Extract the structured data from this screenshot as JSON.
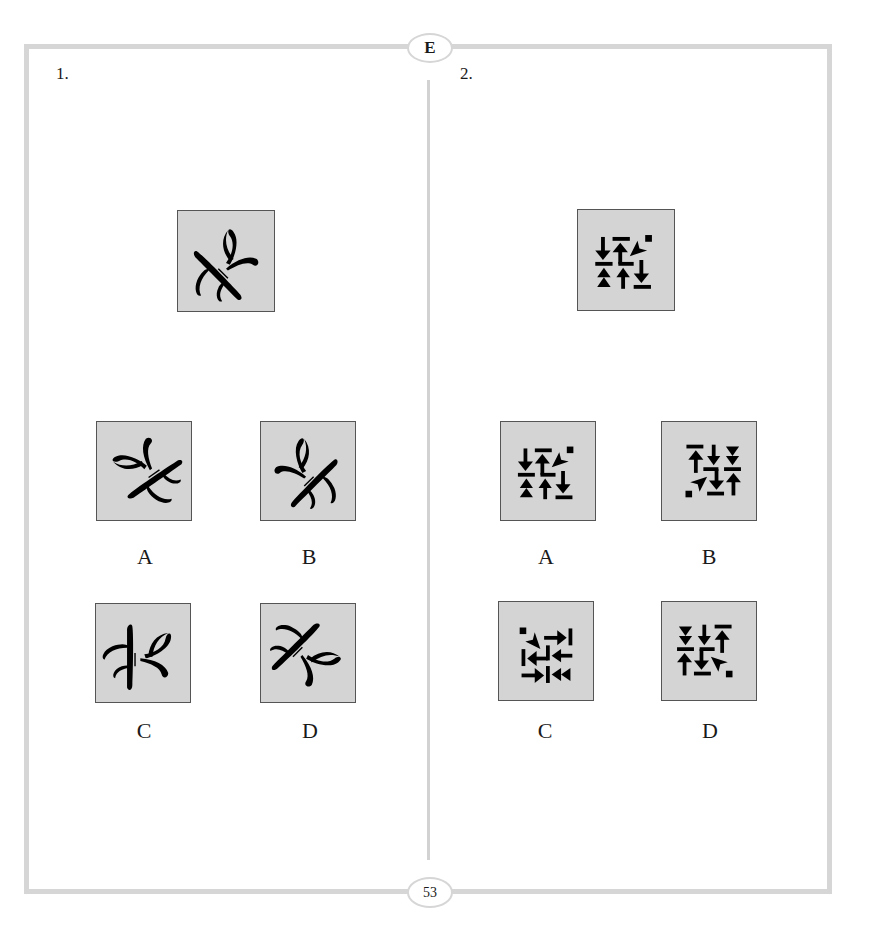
{
  "page": {
    "section_letter": "E",
    "page_number": "53",
    "colors": {
      "border": "#d6d6d6",
      "figure_bg": "#d4d4d4",
      "figure_ink": "#000000"
    }
  },
  "questions": [
    {
      "number": "1.",
      "stimulus_icon": "calligraphic-aleph-glyph",
      "options": [
        {
          "label": "A",
          "icon": "calligraphic-aleph-glyph-rotated"
        },
        {
          "label": "B",
          "icon": "calligraphic-aleph-glyph-mirrored"
        },
        {
          "label": "C",
          "icon": "calligraphic-aleph-glyph-upright"
        },
        {
          "label": "D",
          "icon": "calligraphic-aleph-glyph-rotated-alt"
        }
      ]
    },
    {
      "number": "2.",
      "stimulus_icon": "arrow-grid-pattern",
      "options": [
        {
          "label": "A",
          "icon": "arrow-grid-pattern-variant"
        },
        {
          "label": "B",
          "icon": "arrow-grid-pattern-rotated-180"
        },
        {
          "label": "C",
          "icon": "arrow-grid-pattern-rotated-90"
        },
        {
          "label": "D",
          "icon": "arrow-grid-pattern-mirrored"
        }
      ]
    }
  ]
}
